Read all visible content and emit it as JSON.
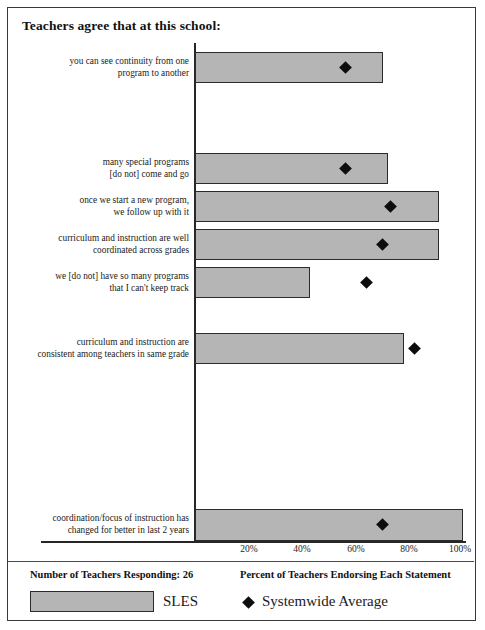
{
  "title": "Teachers agree that at this school:",
  "footer": {
    "respondents": "Number of Teachers Responding: 26",
    "axis_caption": "Percent of Teachers Endorsing Each Statement",
    "legend_bar_label": "SLES",
    "legend_marker_label": "Systemwide Average"
  },
  "colors": {
    "bar_fill": "#b5b5b5",
    "bar_border": "#2b2b2b",
    "marker": "#0d0d0d",
    "axis": "#262626",
    "frame": "#3a3a3a"
  },
  "chart_data": {
    "type": "bar",
    "orientation": "horizontal",
    "title": "Teachers agree that at this school:",
    "xlabel": "Percent of Teachers Endorsing Each Statement",
    "ylabel": "",
    "xlim": [
      0,
      100
    ],
    "xticks": [
      20,
      40,
      60,
      80,
      100
    ],
    "xtick_labels": [
      "20%",
      "40%",
      "60%",
      "80%",
      "100%"
    ],
    "grid": false,
    "legend_position": "bottom",
    "categories": [
      "you can see continuity from one program to another",
      "many special programs [do not] come and go",
      "once we start a new program, we follow up with it",
      "curriculum and instruction are well coordinated across grades",
      "we [do not] have so many programs that I can't keep track",
      "curriculum and instruction are consistent among teachers in same grade",
      "coordination/focus of instruction has changed for better in last 2 years"
    ],
    "series": [
      {
        "name": "SLES",
        "type": "bar",
        "values": [
          70,
          72,
          91,
          91,
          43,
          78,
          100
        ]
      },
      {
        "name": "Systemwide Average",
        "type": "marker",
        "marker": "diamond",
        "values": [
          56,
          56,
          73,
          70,
          64,
          82,
          70
        ]
      }
    ]
  },
  "rows": [
    {
      "label_line1": "you can see continuity from one",
      "label_line2": "program to another",
      "bar_value": 70,
      "marker_value": 56
    },
    {
      "label_line1": "many special programs",
      "label_line2": "[do not] come and go",
      "bar_value": 72,
      "marker_value": 56
    },
    {
      "label_line1": "once we start a new program,",
      "label_line2": "we follow up with it",
      "bar_value": 91,
      "marker_value": 73
    },
    {
      "label_line1": "curriculum and instruction are well",
      "label_line2": "coordinated across grades",
      "bar_value": 91,
      "marker_value": 70
    },
    {
      "label_line1": "we [do not] have so many programs",
      "label_line2": "that I can't keep track",
      "bar_value": 43,
      "marker_value": 64
    },
    {
      "label_line1": "curriculum and instruction are",
      "label_line2": "consistent among teachers in same grade",
      "bar_value": 78,
      "marker_value": 82
    },
    {
      "label_line1": "coordination/focus of instruction has",
      "label_line2": "changed for better in last 2 years",
      "bar_value": 100,
      "marker_value": 70
    }
  ]
}
